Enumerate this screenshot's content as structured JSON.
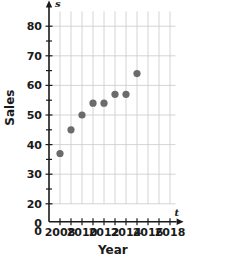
{
  "chart_data": {
    "type": "scatter",
    "title": "",
    "xlabel": "Year",
    "ylabel": "Sales",
    "x_axis_variable": "t",
    "y_axis_variable": "s",
    "x": [
      2008,
      2009,
      2010,
      2011,
      2012,
      2013,
      2014,
      2015
    ],
    "values": [
      37,
      45,
      50,
      54,
      54,
      57,
      57,
      64
    ],
    "points": [
      {
        "x": 2008,
        "y": 37
      },
      {
        "x": 2009,
        "y": 45
      },
      {
        "x": 2010,
        "y": 50
      },
      {
        "x": 2011,
        "y": 54
      },
      {
        "x": 2012,
        "y": 54
      },
      {
        "x": 2013,
        "y": 57
      },
      {
        "x": 2014,
        "y": 57
      },
      {
        "x": 2015,
        "y": 64
      }
    ],
    "xlim": [
      2007,
      2019
    ],
    "ylim": [
      20,
      85
    ],
    "x_tick_labels": [
      "2008",
      "2010",
      "2012",
      "2014",
      "2016",
      "2018"
    ],
    "x_tick_values": [
      2008,
      2010,
      2012,
      2014,
      2016,
      2018
    ],
    "x_gridline_values": [
      2008,
      2009,
      2010,
      2011,
      2012,
      2013,
      2014,
      2015,
      2016,
      2017,
      2018
    ],
    "y_tick_labels": [
      "0",
      "20",
      "30",
      "40",
      "50",
      "60",
      "70",
      "80"
    ],
    "y_tick_values": [
      0,
      20,
      30,
      40,
      50,
      60,
      70,
      80
    ],
    "y_gridline_values": [
      20,
      30,
      40,
      50,
      60,
      70,
      80
    ],
    "y_minor_tick_values": [
      25,
      35,
      45,
      55,
      65,
      75
    ],
    "grid": true,
    "legend": false,
    "origin_label": "0",
    "point_color": "#6b6b6b",
    "grid_color": "#c9c9c9",
    "axis_color": "#1a1a1a"
  },
  "labels": {
    "y_axis_title": "Sales",
    "x_axis_title": "Year",
    "y_variable": "s",
    "x_variable": "t"
  }
}
